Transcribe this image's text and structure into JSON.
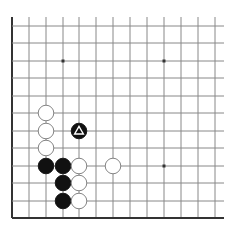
{
  "diagram": {
    "type": "go-board-fragment",
    "grid": {
      "x_lines": [
        12,
        29,
        46,
        63,
        79,
        96,
        113,
        130,
        147,
        164,
        181,
        198,
        215
      ],
      "y_lines": [
        26,
        43,
        61,
        78,
        96,
        113,
        131,
        148,
        166,
        183,
        201,
        218
      ],
      "top_y": 17,
      "right_x": 224,
      "edges": [
        "left",
        "bottom"
      ]
    },
    "hoshi": [
      {
        "col": 3,
        "row": 2
      },
      {
        "col": 9,
        "row": 2
      },
      {
        "col": 9,
        "row": 8
      }
    ],
    "stones": [
      {
        "color": "white",
        "col": 2,
        "row": 5
      },
      {
        "color": "white",
        "col": 2,
        "row": 6
      },
      {
        "color": "white",
        "col": 2,
        "row": 7
      },
      {
        "color": "black",
        "col": 4,
        "row": 6,
        "marker": "triangle"
      },
      {
        "color": "black",
        "col": 2,
        "row": 8
      },
      {
        "color": "black",
        "col": 3,
        "row": 8
      },
      {
        "color": "white",
        "col": 4,
        "row": 8
      },
      {
        "color": "white",
        "col": 6,
        "row": 8
      },
      {
        "color": "black",
        "col": 3,
        "row": 9
      },
      {
        "color": "white",
        "col": 4,
        "row": 9
      },
      {
        "color": "black",
        "col": 3,
        "row": 10
      },
      {
        "color": "white",
        "col": 4,
        "row": 10
      }
    ],
    "colors": {
      "line": "#888888",
      "edge": "#333333",
      "black": "#111111",
      "white": "#ffffff"
    }
  }
}
